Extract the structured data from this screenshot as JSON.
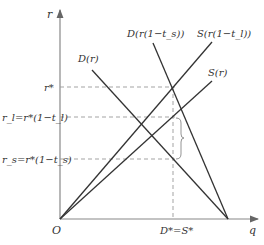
{
  "diagram": {
    "axes": {
      "y_label": "r",
      "x_label": "q",
      "origin_label": "O"
    },
    "y_levels": {
      "r_star": "r*",
      "r_l": "r_l=r*(1−t_l)",
      "r_s": "r_s=r*(1−t_s)"
    },
    "x_levels": {
      "equilibrium": "D*=S*"
    },
    "curves": [
      {
        "id": "D_r",
        "label": "D(r)",
        "type": "demand"
      },
      {
        "id": "D_r_ts",
        "label": "D(r(1−t_s))",
        "type": "demand"
      },
      {
        "id": "S_r_tl",
        "label": "S(r(1−t_l))",
        "type": "supply"
      },
      {
        "id": "S_r",
        "label": "S(r)",
        "type": "supply"
      }
    ],
    "colors": {
      "line": "#333333",
      "dash": "#999999",
      "axis": "#888888"
    },
    "caption": ""
  }
}
